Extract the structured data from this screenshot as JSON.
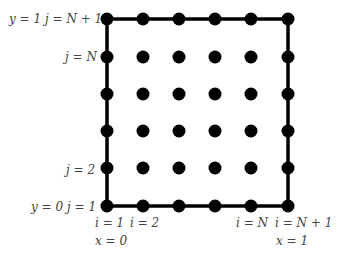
{
  "diagram": {
    "type": "finite-difference-grid",
    "grid": {
      "columns": 6,
      "rows": 6,
      "x_px": [
        107,
        143,
        179,
        215,
        251,
        288
      ],
      "y_px": [
        19,
        57,
        94,
        131,
        168,
        206
      ],
      "boundary_color": "#000000",
      "point_color": "#000000"
    },
    "labels": {
      "y_top": "y = 1",
      "j_top": "j = N + 1",
      "j_N": "j = N",
      "j_2": "j = 2",
      "y_bottom": "y = 0",
      "j_1": "j = 1",
      "i_1": "i = 1",
      "i_2": "i = 2",
      "i_N": "i = N",
      "i_N1": "i = N + 1",
      "x_left": "x = 0",
      "x_right": "x = 1"
    }
  }
}
